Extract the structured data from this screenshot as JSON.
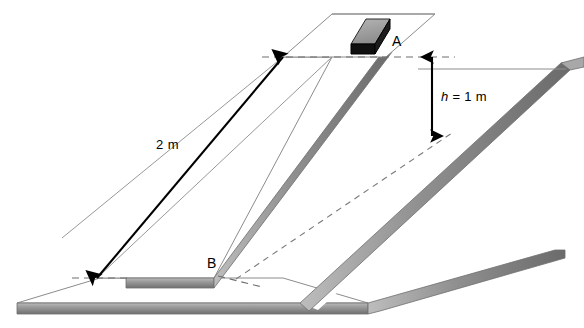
{
  "figure": {
    "kind": "inclined-plane-diagram",
    "labels": {
      "point_top": "A",
      "point_bottom": "B",
      "slope_length": "2 m",
      "height_var": "h",
      "height_eq": " = 1 m"
    },
    "colors": {
      "line": "#000000",
      "outline_light": "#8c8c8c",
      "edge_gray": "#8f8f8f",
      "edge_gray_light": "#b4b4b4",
      "edge_gray_dark": "#6e6e6e",
      "block_top": "#9a9a9a",
      "block_side": "#0d0d0d",
      "dashed": "#7a7a7a",
      "background": "#ffffff"
    },
    "geometry": {
      "base_plate": "17,303 100,278 283,278 368,303",
      "base_plate_right_far": "368,303 555,250 584,250",
      "ramp_left_top_face": "97,278 214,278 332,57 283,57",
      "ramp_left_front_edge": "97,278 214,278 214,286 97,286",
      "ramp_right_top_face": "266,286 392,286 516,63 466,63",
      "upper_platform": "283,57 332,14 435,14 385,57",
      "h_arrow_x": 432,
      "h_arrow_top_y": 57,
      "h_arrow_bottom_y": 136,
      "len_arrow": "97,278 283,57"
    }
  }
}
